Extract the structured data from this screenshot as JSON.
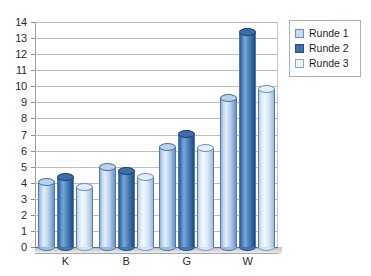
{
  "chart_data": {
    "type": "bar",
    "title": "",
    "xlabel": "",
    "ylabel": "",
    "categories": [
      "K",
      "B",
      "G",
      "W"
    ],
    "series": [
      {
        "name": "Runde 1",
        "color": "#c5dcf2",
        "values": [
          4.3,
          5.2,
          6.5,
          9.5
        ]
      },
      {
        "name": "Runde 2",
        "color": "#3f6fa9",
        "values": [
          4.6,
          5.0,
          7.3,
          13.6
        ]
      },
      {
        "name": "Runde 3",
        "color": "#edf4fc",
        "values": [
          4.0,
          4.6,
          6.4,
          10.1
        ]
      }
    ],
    "ylim": [
      0,
      14
    ],
    "ytick_step": 1,
    "yticks": [
      "14",
      "13",
      "12",
      "11",
      "10",
      "9",
      "8",
      "7",
      "6",
      "5",
      "4",
      "3",
      "2",
      "1",
      "0"
    ],
    "grid": true,
    "legend_position": "right",
    "style": "3d-cylinder"
  },
  "legend": {
    "items": [
      {
        "label": "Runde 1"
      },
      {
        "label": "Runde 2"
      },
      {
        "label": "Runde 3"
      }
    ]
  }
}
